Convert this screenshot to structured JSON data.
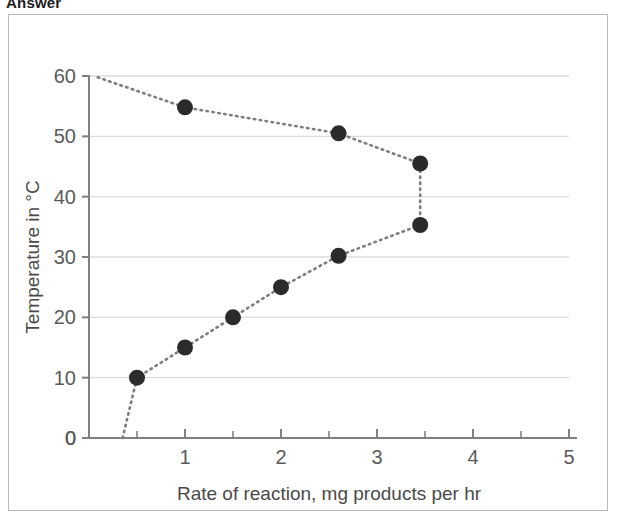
{
  "page": {
    "heading": "Answer"
  },
  "chart_data": {
    "type": "line",
    "title": "",
    "xlabel": "Rate of reaction, mg products per hr",
    "ylabel": "Temperature in °C",
    "xlim": [
      0,
      5
    ],
    "ylim": [
      0,
      60
    ],
    "xticks": [
      0,
      1,
      2,
      3,
      4,
      5
    ],
    "xtick_labels": [
      "0",
      "1",
      "2",
      "3",
      "4",
      "5"
    ],
    "xminor_ticks": [
      0.5,
      1.5,
      2.5,
      3.5,
      4.5
    ],
    "yticks": [
      0,
      10,
      20,
      30,
      40,
      50,
      60
    ],
    "ytick_labels": [
      "0",
      "10",
      "20",
      "30",
      "40",
      "50",
      "60"
    ],
    "grid": "horizontal",
    "legend": "none",
    "marker": "filled-circle",
    "marker_color": "#2b2b2b",
    "marker_size_px": 16,
    "line_style": "dotted",
    "line_color": "#7d7d7d",
    "series": [
      {
        "name": "Rate of reaction vs temperature",
        "orientation": "x-is-rate, y-is-temperature",
        "points": [
          {
            "x": 0.35,
            "y": 0,
            "marker": false
          },
          {
            "x": 0.5,
            "y": 10,
            "marker": true
          },
          {
            "x": 1.0,
            "y": 15,
            "marker": true
          },
          {
            "x": 1.5,
            "y": 20,
            "marker": true
          },
          {
            "x": 2.0,
            "y": 25,
            "marker": true
          },
          {
            "x": 2.6,
            "y": 30.2,
            "marker": true
          },
          {
            "x": 3.45,
            "y": 35.3,
            "marker": true
          },
          {
            "x": 3.45,
            "y": 45.5,
            "marker": true
          },
          {
            "x": 2.6,
            "y": 50.5,
            "marker": true
          },
          {
            "x": 1.0,
            "y": 54.8,
            "marker": true
          },
          {
            "x": 0.05,
            "y": 60,
            "marker": false
          }
        ]
      }
    ]
  },
  "colors": {
    "frame_border": "#b9b9b9",
    "grid": "#dcdcdc",
    "axis": "#808080",
    "text": "#5a5a5a",
    "background": "#ffffff"
  }
}
